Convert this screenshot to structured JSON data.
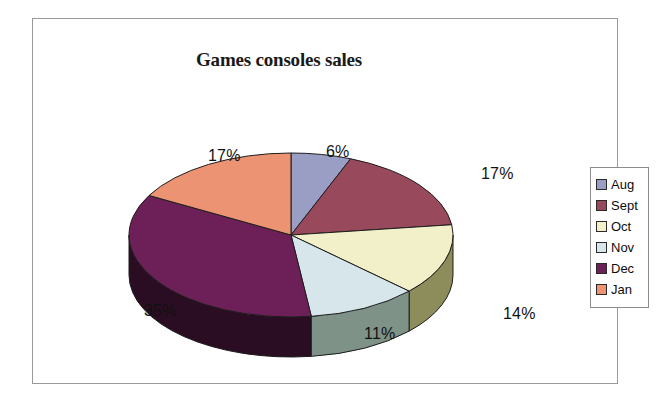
{
  "chart_data": {
    "type": "pie",
    "title": "Games consoles sales",
    "xlabel": "",
    "ylabel": "",
    "legend_position": "right",
    "grid": false,
    "three_d": true,
    "categories": [
      "Aug",
      "Sept",
      "Oct",
      "Nov",
      "Dec",
      "Jan"
    ],
    "values": [
      6,
      17,
      14,
      11,
      35,
      17
    ],
    "value_labels": [
      "6%",
      "17%",
      "14%",
      "11%",
      "35%",
      "17%"
    ],
    "unit": "%",
    "colors": [
      "#9a9ec4",
      "#984a5c",
      "#f2f0c8",
      "#d7e6ea",
      "#6d2057",
      "#eb9372"
    ],
    "side_colors": [
      "#6d7190",
      "#6b3441",
      "#8c8d5a",
      "#7e9287",
      "#2a0d22",
      "#a76651"
    ],
    "slices": [
      {
        "label": "Aug",
        "value": 6,
        "display": "6%",
        "color": "#9a9ec4",
        "side_color": "#6d7190"
      },
      {
        "label": "Sept",
        "value": 17,
        "display": "17%",
        "color": "#984a5c",
        "side_color": "#6b3441"
      },
      {
        "label": "Oct",
        "value": 14,
        "display": "14%",
        "color": "#f2f0c8",
        "side_color": "#8c8d5a"
      },
      {
        "label": "Nov",
        "value": 11,
        "display": "11%",
        "color": "#d7e6ea",
        "side_color": "#7e9287"
      },
      {
        "label": "Dec",
        "value": 35,
        "display": "35%",
        "color": "#6d2057",
        "side_color": "#2a0d22"
      },
      {
        "label": "Jan",
        "value": 17,
        "display": "17%",
        "color": "#eb9372",
        "side_color": "#a76651"
      }
    ]
  },
  "legend": {
    "items": [
      {
        "label": "Aug",
        "color": "#9a9ec4"
      },
      {
        "label": "Sept",
        "color": "#984a5c"
      },
      {
        "label": "Oct",
        "color": "#f2f0c8"
      },
      {
        "label": "Nov",
        "color": "#d7e6ea"
      },
      {
        "label": "Dec",
        "color": "#6d2057"
      },
      {
        "label": "Jan",
        "color": "#eb9372"
      }
    ]
  }
}
